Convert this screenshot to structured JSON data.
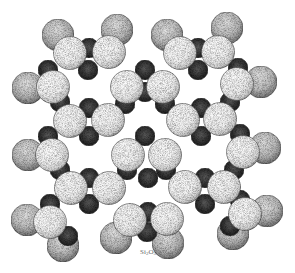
{
  "figure": {
    "label": "Si",
    "label_sub1": "2",
    "label_mid": "O",
    "label_sub2": "5",
    "label_pos": [
      148,
      253
    ]
  },
  "colors": {
    "background": "#ffffff",
    "oxygen_front": "#f4f4f4",
    "oxygen_back": "#bdbdbd",
    "silicon": "#2a2a2a",
    "label": "#6a6a6a"
  },
  "atoms": {
    "radius_front": 16.5,
    "radius_back": 16,
    "radius_si": 10,
    "back_oxygens": [
      [
        58,
        35
      ],
      [
        117,
        30
      ],
      [
        167,
        35
      ],
      [
        227,
        28
      ],
      [
        28,
        88
      ],
      [
        261,
        82
      ],
      [
        28,
        155
      ],
      [
        265,
        148
      ],
      [
        27,
        220
      ],
      [
        267,
        211
      ],
      [
        63,
        246
      ],
      [
        116,
        238
      ],
      [
        168,
        243
      ],
      [
        233,
        234
      ]
    ],
    "silicons": [
      [
        89,
        48
      ],
      [
        198,
        48
      ],
      [
        48,
        70
      ],
      [
        88,
        70
      ],
      [
        145,
        70
      ],
      [
        198,
        70
      ],
      [
        238,
        68
      ],
      [
        60,
        102
      ],
      [
        89,
        108
      ],
      [
        125,
        104
      ],
      [
        145,
        92
      ],
      [
        165,
        104
      ],
      [
        201,
        108
      ],
      [
        230,
        102
      ],
      [
        48,
        136
      ],
      [
        89,
        136
      ],
      [
        145,
        136
      ],
      [
        201,
        136
      ],
      [
        240,
        134
      ],
      [
        60,
        170
      ],
      [
        89,
        178
      ],
      [
        127,
        170
      ],
      [
        148,
        178
      ],
      [
        166,
        170
      ],
      [
        205,
        178
      ],
      [
        234,
        170
      ],
      [
        50,
        204
      ],
      [
        89,
        204
      ],
      [
        148,
        212
      ],
      [
        205,
        204
      ],
      [
        240,
        200
      ],
      [
        68,
        236
      ],
      [
        147,
        232
      ],
      [
        230,
        226
      ]
    ],
    "front_oxygens": [
      [
        70,
        53
      ],
      [
        109,
        52
      ],
      [
        180,
        53
      ],
      [
        218,
        52
      ],
      [
        53,
        87
      ],
      [
        127,
        87
      ],
      [
        163,
        87
      ],
      [
        237,
        84
      ],
      [
        70,
        121
      ],
      [
        108,
        120
      ],
      [
        183,
        120
      ],
      [
        220,
        119
      ],
      [
        52,
        155
      ],
      [
        128,
        155
      ],
      [
        165,
        155
      ],
      [
        243,
        152
      ],
      [
        71,
        188
      ],
      [
        109,
        188
      ],
      [
        185,
        187
      ],
      [
        224,
        187
      ],
      [
        50,
        222
      ],
      [
        130,
        220
      ],
      [
        167,
        219
      ],
      [
        245,
        214
      ]
    ]
  }
}
